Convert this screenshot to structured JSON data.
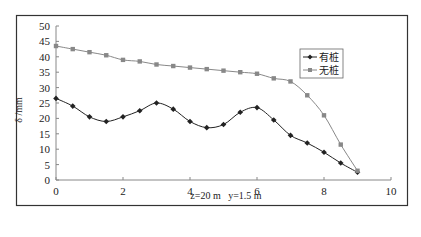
{
  "chart_data": {
    "type": "line",
    "title": "",
    "xlabel": "z=20 m   y=1.5 m",
    "ylabel": "δ /mm",
    "xlim": [
      0,
      10
    ],
    "ylim": [
      0,
      50
    ],
    "xticks": [
      0,
      2,
      4,
      6,
      8,
      10
    ],
    "yticks": [
      0,
      5,
      10,
      15,
      20,
      25,
      30,
      35,
      40,
      45,
      50
    ],
    "grid": false,
    "legend_position": "upper right",
    "x": [
      0,
      0.5,
      1,
      1.5,
      2,
      2.5,
      3,
      3.5,
      4,
      4.5,
      5,
      5.5,
      6,
      6.5,
      7,
      7.5,
      8,
      8.5,
      9
    ],
    "series": [
      {
        "name": "有桩",
        "marker": "diamond",
        "color": "#222222",
        "values": [
          26.5,
          24,
          20.5,
          19,
          20.5,
          22.5,
          25,
          23,
          19,
          17,
          18,
          22,
          23.5,
          19.5,
          14.5,
          12,
          9,
          5.5,
          2.5
        ]
      },
      {
        "name": "无桩",
        "marker": "square",
        "color": "#888888",
        "values": [
          43.5,
          42.5,
          41.5,
          40.5,
          39,
          38.5,
          37.5,
          37,
          36.5,
          36,
          35.5,
          35,
          34.5,
          33,
          32,
          27.5,
          21,
          11.5,
          3
        ]
      }
    ]
  }
}
